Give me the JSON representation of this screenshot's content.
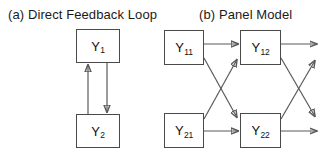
{
  "figure": {
    "width": 328,
    "height": 163,
    "background": "#ffffff",
    "stroke_color": "#5a5a5a",
    "box_border_color": "#4a4a4a",
    "text_color": "#111111"
  },
  "panel_a": {
    "title": "(a)  Direct Feedback Loop",
    "nodes": [
      {
        "id": "Y1",
        "base": "Y",
        "sub": "1",
        "x": 76,
        "y": 29,
        "w": 44,
        "h": 34
      },
      {
        "id": "Y2",
        "base": "Y",
        "sub": "2",
        "x": 76,
        "y": 114,
        "w": 44,
        "h": 34
      }
    ],
    "edges": [
      {
        "from": "Y2",
        "to": "Y1",
        "kind": "vertical-up",
        "x": 88,
        "y1": 114,
        "y2": 63
      },
      {
        "from": "Y1",
        "to": "Y2",
        "kind": "vertical-down",
        "x": 107,
        "y1": 63,
        "y2": 114
      }
    ]
  },
  "panel_b": {
    "title": "(b)  Panel Model",
    "nodes": [
      {
        "id": "Y11",
        "base": "Y",
        "sub": "11",
        "x": 164,
        "y": 30,
        "w": 40,
        "h": 35
      },
      {
        "id": "Y12",
        "base": "Y",
        "sub": "12",
        "x": 240,
        "y": 30,
        "w": 41,
        "h": 35
      },
      {
        "id": "Y21",
        "base": "Y",
        "sub": "21",
        "x": 164,
        "y": 113,
        "w": 40,
        "h": 35
      },
      {
        "id": "Y22",
        "base": "Y",
        "sub": "22",
        "x": 240,
        "y": 113,
        "w": 41,
        "h": 35
      }
    ],
    "edges": [
      {
        "from": "Y11",
        "to": "Y12",
        "kind": "autoregressive-top",
        "x1": 204,
        "y1": 44,
        "x2": 238,
        "y2": 44
      },
      {
        "from": "Y21",
        "to": "Y22",
        "kind": "autoregressive-bottom",
        "x1": 204,
        "y1": 131,
        "x2": 238,
        "y2": 131
      },
      {
        "from": "Y11",
        "to": "Y22",
        "kind": "cross-lagged-down",
        "x1": 204,
        "y1": 58,
        "x2": 238,
        "y2": 119
      },
      {
        "from": "Y21",
        "to": "Y12",
        "kind": "cross-lagged-up",
        "x1": 204,
        "y1": 119,
        "x2": 238,
        "y2": 58
      },
      {
        "from": "Y12",
        "to": "next",
        "kind": "continuation-top",
        "x1": 281,
        "y1": 44,
        "x2": 318,
        "y2": 44
      },
      {
        "from": "Y22",
        "to": "next",
        "kind": "continuation-bottom",
        "x1": 281,
        "y1": 131,
        "x2": 318,
        "y2": 131
      },
      {
        "from": "Y12",
        "to": "next",
        "kind": "continuation-cross-down",
        "x1": 281,
        "y1": 58,
        "x2": 318,
        "y2": 118
      },
      {
        "from": "Y22",
        "to": "next",
        "kind": "continuation-cross-up",
        "x1": 281,
        "y1": 119,
        "x2": 318,
        "y2": 59
      }
    ]
  }
}
